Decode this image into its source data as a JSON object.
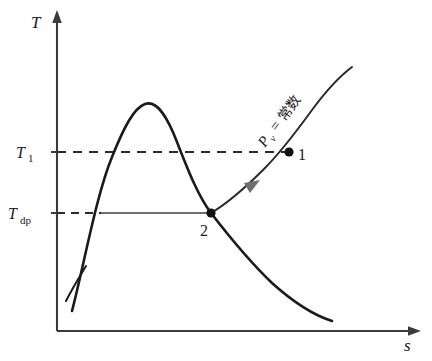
{
  "figure": {
    "kind": "temperature-entropy-diagram",
    "background_color": "#ffffff"
  },
  "axes": {
    "y_label": "T",
    "x_label": "s",
    "y_axis_color": "#3a3a3a",
    "x_axis_color": "#3a3a3a"
  },
  "temperature_ticks": [
    {
      "id": "T1",
      "base": "T",
      "subscript": "1",
      "line_style": "dashed",
      "line_color": "#2b2b2b"
    },
    {
      "id": "Tdp",
      "base": "T",
      "subscript": "dp",
      "line_style": "solid-gray",
      "line_color": "#6e6e6e"
    }
  ],
  "states": [
    {
      "id": "state-1",
      "label": "1",
      "marker": "filled-dot",
      "marker_color": "#111111"
    },
    {
      "id": "state-2",
      "label": "2",
      "marker": "filled-dot",
      "marker_color": "#111111"
    }
  ],
  "isobar": {
    "label_base": "P",
    "label_subscript": "v",
    "label_equals": "=",
    "label_value": "常数",
    "curve_color": "#2a2a2a",
    "process_arrow_color": "#6e6e6e",
    "process_direction": "1-to-2"
  },
  "saturation_dome": {
    "name": "saturation-dome",
    "curve_color": "#1a1a1a"
  }
}
